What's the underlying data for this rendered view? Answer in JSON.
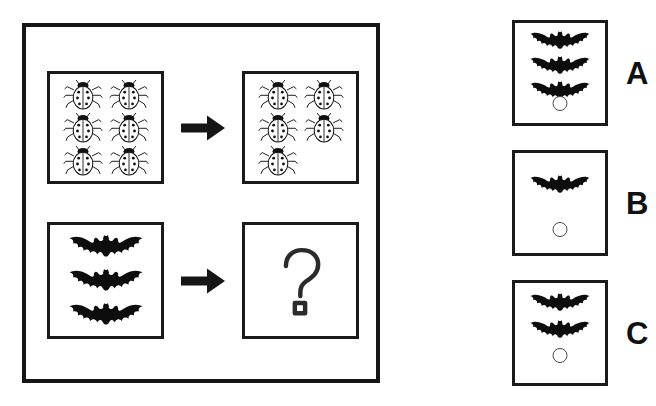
{
  "puzzle": {
    "type": "visual-analogy-matrix",
    "panel_label": "analogy-panel",
    "rows": [
      {
        "name": "ladybug-row",
        "source": {
          "icon": "ladybug-icon",
          "count": 6,
          "layout": "2-column grid"
        },
        "operator": {
          "icon": "arrow-right-icon",
          "label": "becomes"
        },
        "result": {
          "icon": "ladybug-icon",
          "count": 5,
          "layout": "2-column grid"
        }
      },
      {
        "name": "bat-row",
        "source": {
          "icon": "bat-icon",
          "count": 3,
          "layout": "vertical stack"
        },
        "operator": {
          "icon": "arrow-right-icon",
          "label": "becomes"
        },
        "result": {
          "icon": "question-mark-icon",
          "count": 0,
          "label": "?"
        }
      }
    ]
  },
  "options": [
    {
      "letter": "A",
      "icon": "bat-icon",
      "count": 3,
      "bubble": "radio-bubble"
    },
    {
      "letter": "B",
      "icon": "bat-icon",
      "count": 1,
      "bubble": "radio-bubble"
    },
    {
      "letter": "C",
      "icon": "bat-icon",
      "count": 2,
      "bubble": "radio-bubble"
    }
  ],
  "colors": {
    "ink": "#161616",
    "frame": "#1a1a1a",
    "bubble_stroke": "#4a4a4a",
    "background": "#ffffff"
  }
}
